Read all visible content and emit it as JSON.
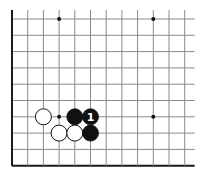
{
  "board": {
    "cols": 12,
    "rows": 10,
    "origin_x": 12,
    "origin_y": 19,
    "spacing_x": 15.7,
    "spacing_y": 16.3,
    "open_right_extend": 10,
    "open_top_extend": 9,
    "edges": {
      "left": true,
      "bottom": true,
      "top": false,
      "right": false
    },
    "line_color": "#8a8a8a",
    "edge_color": "#1a1a1a",
    "star_points": [
      {
        "col": 3,
        "row": 0
      },
      {
        "col": 9,
        "row": 0
      },
      {
        "col": 3,
        "row": 6
      },
      {
        "col": 9,
        "row": 6
      }
    ],
    "stones": [
      {
        "color": "white",
        "col": 2,
        "row": 6,
        "label": ""
      },
      {
        "color": "black",
        "col": 4,
        "row": 6,
        "label": ""
      },
      {
        "color": "black",
        "col": 5,
        "row": 6,
        "label": "1"
      },
      {
        "color": "white",
        "col": 3,
        "row": 7,
        "label": ""
      },
      {
        "color": "white",
        "col": 4,
        "row": 7,
        "label": ""
      },
      {
        "color": "black",
        "col": 5,
        "row": 7,
        "label": ""
      }
    ],
    "stone_radius": 8
  }
}
